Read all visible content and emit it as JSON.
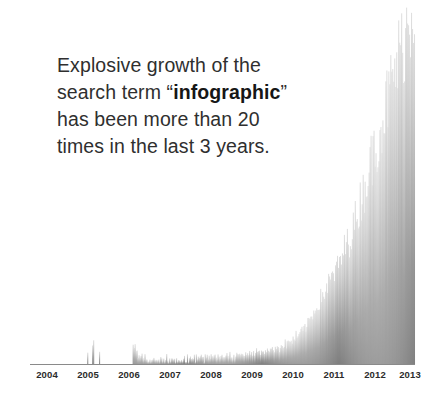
{
  "caption": {
    "line1": "Explosive growth of the",
    "line2_pre": "search term “",
    "line2_em": "infographic",
    "line2_post": "”",
    "line3": "has been more than 20",
    "line4": "times in the last 3 years."
  },
  "colors": {
    "background": "#ffffff",
    "text": "#2f2f2f",
    "text_bold": "#161616",
    "axis": "#8a8a8a",
    "fill_bottom": "#808080",
    "fill_top": "#d8d8d8",
    "tick_label": "#2b2b2b"
  },
  "chart_data": {
    "type": "area",
    "title": "",
    "subtitle": "",
    "xlabel": "",
    "ylabel": "",
    "grid": false,
    "legend": "none",
    "xlim": [
      2004.0,
      2013.9
    ],
    "ylim": [
      0,
      100
    ],
    "tick_labels": [
      "2004",
      "2005",
      "2006",
      "2007",
      "2008",
      "2009",
      "2010",
      "2011",
      "2012",
      "2013"
    ],
    "tick_positions": [
      2004.0,
      2005.0,
      2006.0,
      2007.0,
      2008.0,
      2009.0,
      2010.0,
      2011.0,
      2012.0,
      2013.0
    ],
    "series": [
      {
        "name": "infographic",
        "note": "Weekly Google-Trends style search interest, 0-100 scale",
        "x_start": 2004.0,
        "x_step": 0.01923,
        "values": [
          0,
          0,
          0,
          0,
          0,
          0,
          0,
          0,
          0,
          0,
          0,
          0,
          0,
          0,
          0,
          0,
          0,
          0,
          0,
          0,
          0,
          0,
          0,
          0,
          0,
          0,
          0,
          0,
          0,
          0,
          0,
          0,
          0,
          0,
          0,
          0,
          0,
          0,
          0,
          0,
          0,
          0,
          0,
          0,
          0,
          0,
          0,
          0,
          0,
          0,
          0,
          0,
          0,
          0,
          0,
          0,
          0,
          0,
          3,
          0,
          0,
          0,
          0,
          5,
          6,
          0,
          0,
          0,
          0,
          0,
          4,
          0,
          0,
          0,
          0,
          0,
          0,
          0,
          0,
          0,
          0,
          0,
          0,
          0,
          0,
          0,
          0,
          0,
          0,
          0,
          0,
          0,
          0,
          0,
          0,
          0,
          0,
          0,
          0,
          0,
          0,
          0,
          0,
          0,
          6,
          4,
          5,
          3,
          4,
          2,
          3,
          2,
          2,
          3,
          2,
          1,
          2,
          1,
          2,
          1,
          1,
          2,
          1,
          1,
          1,
          2,
          1,
          1,
          1,
          1,
          1,
          1,
          2,
          1,
          1,
          1,
          1,
          1,
          2,
          1,
          1,
          1,
          1,
          1,
          1,
          1,
          2,
          1,
          2,
          1,
          1,
          1,
          1,
          1,
          1,
          1,
          2,
          1,
          1,
          2,
          1,
          1,
          2,
          2,
          1,
          2,
          2,
          1,
          2,
          2,
          2,
          1,
          2,
          2,
          2,
          2,
          1,
          2,
          2,
          2,
          2,
          2,
          2,
          2,
          2,
          2,
          2,
          2,
          2,
          2,
          2,
          2,
          2,
          2,
          2,
          2,
          2,
          2,
          2,
          3,
          2,
          2,
          3,
          2,
          2,
          2,
          2,
          2,
          2,
          3,
          2,
          3,
          3,
          2,
          3,
          3,
          2,
          3,
          3,
          3,
          3,
          3,
          3,
          3,
          3,
          3,
          3,
          3,
          3,
          4,
          3,
          3,
          4,
          3,
          3,
          4,
          4,
          3,
          4,
          4,
          4,
          4,
          4,
          4,
          4,
          4,
          4,
          4,
          5,
          4,
          5,
          5,
          4,
          5,
          5,
          5,
          5,
          5,
          6,
          5,
          6,
          6,
          6,
          6,
          7,
          6,
          7,
          7,
          7,
          8,
          7,
          8,
          8,
          8,
          9,
          9,
          9,
          10,
          10,
          10,
          11,
          11,
          12,
          12,
          13,
          13,
          14,
          14,
          15,
          15,
          16,
          16,
          17,
          17,
          18,
          18,
          19,
          19,
          20,
          20,
          21,
          21,
          22,
          22,
          23,
          23,
          24,
          24,
          25,
          25,
          26,
          26,
          27,
          28,
          28,
          29,
          30,
          30,
          31,
          32,
          32,
          33,
          34,
          34,
          35,
          36,
          37,
          37,
          38,
          39,
          40,
          41,
          42,
          43,
          44,
          45,
          46,
          47,
          48,
          49,
          50,
          51,
          52,
          53,
          54,
          55,
          56,
          57,
          58,
          59,
          60,
          61,
          62,
          63,
          64,
          65,
          66,
          67,
          68,
          69,
          70,
          71,
          72,
          73,
          74,
          75,
          76,
          77,
          78,
          79,
          80,
          81,
          82,
          83,
          84,
          85,
          86,
          87,
          88,
          89,
          90,
          91,
          92,
          93,
          94,
          95,
          96,
          97,
          98,
          100
        ]
      }
    ]
  }
}
